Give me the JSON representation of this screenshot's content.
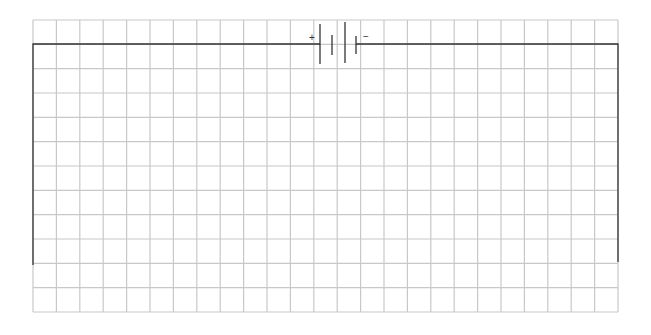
{
  "diagram": {
    "type": "circuit",
    "grid": {
      "left": 33,
      "top": 20,
      "right": 618,
      "bottom": 312,
      "cols": 25,
      "rows": 12,
      "color": "#c8c8c8"
    },
    "wire_color": "#333333",
    "battery": {
      "positive_label": "+",
      "negative_label": "−",
      "cells": 2
    },
    "components": [
      "battery",
      "wire"
    ]
  }
}
